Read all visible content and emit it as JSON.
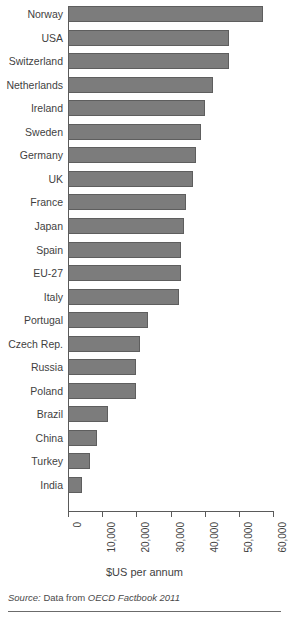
{
  "chart_data": {
    "type": "bar",
    "orientation": "horizontal",
    "title": "",
    "xlabel": "$US per annum",
    "ylabel": "",
    "xlim": [
      0,
      60000
    ],
    "xticks": [
      0,
      10000,
      20000,
      30000,
      40000,
      50000,
      60000
    ],
    "xtick_labels": [
      "0",
      "10,000",
      "20,000",
      "30,000",
      "40,000",
      "50,000",
      "60,000"
    ],
    "grid": false,
    "legend": false,
    "bar_color": "#7c7c7c",
    "bar_border_color": "#5e5e5e",
    "axis_color": "#5a5a5a",
    "categories": [
      "Norway",
      "USA",
      "Switzerland",
      "Netherlands",
      "Ireland",
      "Sweden",
      "Germany",
      "UK",
      "France",
      "Japan",
      "Spain",
      "EU-27",
      "Italy",
      "Portugal",
      "Czech Rep.",
      "Russia",
      "Poland",
      "Brazil",
      "China",
      "Turkey",
      "India"
    ],
    "values": [
      57000,
      47000,
      47000,
      42500,
      40000,
      39000,
      37500,
      36500,
      34500,
      34000,
      33000,
      33000,
      32500,
      23500,
      21000,
      20000,
      20000,
      11800,
      8500,
      6500,
      4000
    ]
  },
  "source": {
    "label": "Source:",
    "prefix": "Data from",
    "work": "OECD Factbook 2011"
  }
}
